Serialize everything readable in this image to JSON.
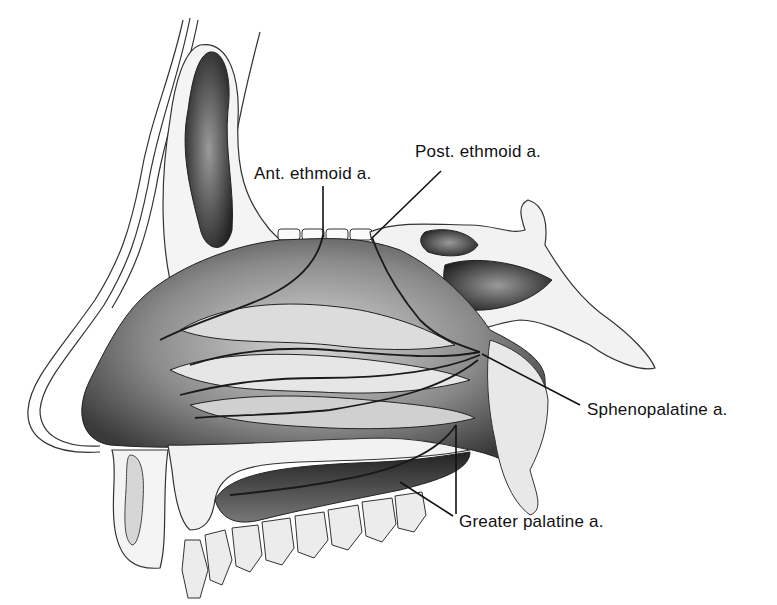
{
  "figure": {
    "background": "#ffffff",
    "ink": "#111111",
    "labels": [
      {
        "id": "ant-ethmoid",
        "text": "Ant. ethmoid a.",
        "x": 254,
        "y": 165
      },
      {
        "id": "post-ethmoid",
        "text": "Post. ethmoid a.",
        "x": 415,
        "y": 143
      },
      {
        "id": "sphenopalatine",
        "text": "Sphenopalatine a.",
        "x": 587,
        "y": 401
      },
      {
        "id": "greater-palatine",
        "text": "Greater palatine a.",
        "x": 459,
        "y": 513
      }
    ]
  }
}
